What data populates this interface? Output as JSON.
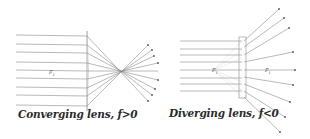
{
  "diagrams": [
    {
      "id": "converging",
      "caption": "Converging lens, f>0",
      "focal_label": "F",
      "focal_sub": "1"
    },
    {
      "id": "diverging",
      "caption": "Diverging lens, f<0",
      "focal_label_left": "F",
      "focal_sub_left": "1",
      "focal_label_right": "F",
      "focal_sub_right": "1"
    }
  ],
  "colors": {
    "ray": "#8a8a8a",
    "lens": "#9a9a9a",
    "virtual_ray": "#dcdcdc",
    "text": "#2a2a2a"
  }
}
